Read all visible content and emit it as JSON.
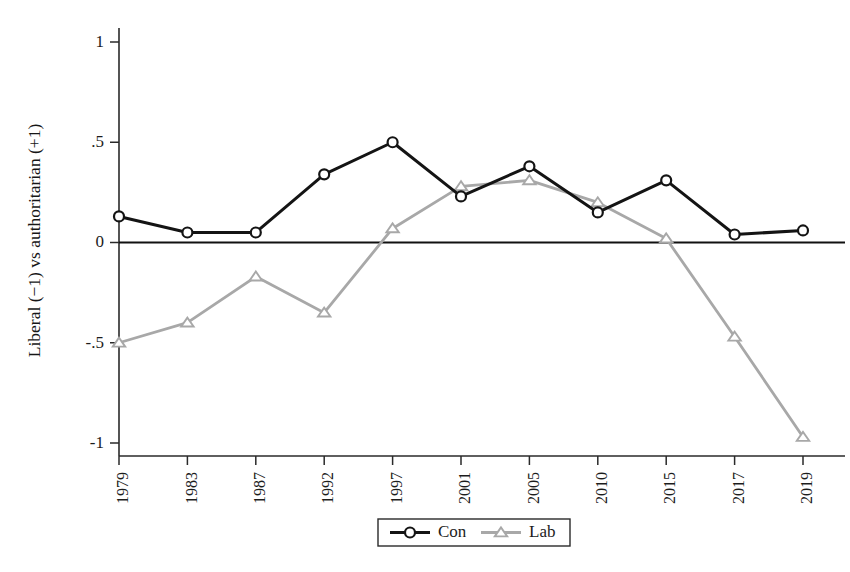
{
  "chart_data": {
    "type": "line",
    "title": "",
    "xlabel": "",
    "ylabel": "Liberal (−1) vs authoritarian (+1)",
    "categories": [
      "1979",
      "1983",
      "1987",
      "1992",
      "1997",
      "2001",
      "2005",
      "2010",
      "2015",
      "2017",
      "2019"
    ],
    "ylim": [
      -1,
      1
    ],
    "yticks": [
      1,
      0.5,
      0,
      -0.5,
      -1
    ],
    "ytick_labels": [
      "1",
      ".5",
      "0",
      "-.5",
      "-1"
    ],
    "grid": false,
    "zero_reference_line": true,
    "legend_position": "bottom-center",
    "series": [
      {
        "name": "Con",
        "color": "#141414",
        "marker": "circle",
        "values": [
          0.13,
          0.05,
          0.05,
          0.34,
          0.5,
          0.23,
          0.38,
          0.15,
          0.31,
          0.04,
          0.06
        ]
      },
      {
        "name": "Lab",
        "color": "#a8a8a8",
        "marker": "triangle",
        "values": [
          -0.5,
          -0.4,
          -0.17,
          -0.35,
          0.07,
          0.28,
          0.31,
          0.2,
          0.02,
          -0.47,
          -0.97
        ]
      }
    ]
  },
  "legend": {
    "entries": [
      {
        "label": "Con"
      },
      {
        "label": "Lab"
      }
    ]
  },
  "colors": {
    "con": "#141414",
    "lab": "#a8a8a8",
    "axis": "#2a2a2a",
    "background": "#ffffff"
  }
}
